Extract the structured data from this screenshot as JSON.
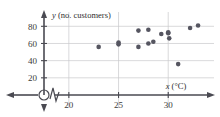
{
  "chart_data": {
    "type": "scatter",
    "title": "",
    "xlabel": "x (°C)",
    "ylabel": "y (no. customers)",
    "xlabel_var": "x",
    "xlabel_unit": "(°C)",
    "ylabel_var": "y",
    "ylabel_unit": "(no. customers)",
    "xlim": [
      17.5,
      33.8
    ],
    "ylim": [
      0,
      92
    ],
    "xticks": [
      20,
      25,
      30
    ],
    "yticks": [
      20,
      40,
      60,
      80
    ],
    "xtick_labels": [
      "20",
      "25",
      "30"
    ],
    "ytick_labels": [
      "20",
      "40",
      "60",
      "80"
    ],
    "grid": true,
    "legend": "none",
    "axis_break_x": true,
    "origin_symbol": "circled-origin",
    "point_color": "#555560",
    "grid_color": "#c8c8cc",
    "axis_color": "#4a4a52",
    "x": [
      23.0,
      25.0,
      25.0,
      27.0,
      27.0,
      28.0,
      28.0,
      28.5,
      29.3,
      30.0,
      30.0,
      30.1,
      31.0,
      32.2,
      33.0
    ],
    "y": [
      56.0,
      61.0,
      59.0,
      75.0,
      56.0,
      76.0,
      60.0,
      62.0,
      71.0,
      73.0,
      72.0,
      66.0,
      36.0,
      78.0,
      81.0
    ],
    "points": [
      {
        "x": 23.0,
        "y": 56
      },
      {
        "x": 25.0,
        "y": 61
      },
      {
        "x": 25.0,
        "y": 59
      },
      {
        "x": 27.0,
        "y": 75
      },
      {
        "x": 27.0,
        "y": 56
      },
      {
        "x": 28.0,
        "y": 76
      },
      {
        "x": 28.0,
        "y": 60
      },
      {
        "x": 28.5,
        "y": 62
      },
      {
        "x": 29.3,
        "y": 71
      },
      {
        "x": 30.0,
        "y": 73
      },
      {
        "x": 30.0,
        "y": 72
      },
      {
        "x": 30.1,
        "y": 66
      },
      {
        "x": 31.0,
        "y": 36
      },
      {
        "x": 32.2,
        "y": 78
      },
      {
        "x": 33.0,
        "y": 81
      }
    ]
  }
}
